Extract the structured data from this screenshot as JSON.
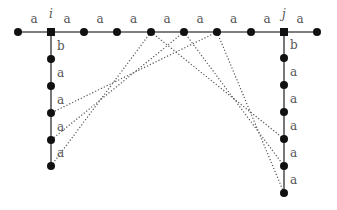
{
  "colors": {
    "edge": "#555555",
    "node": "#111111",
    "dotted": "#555555",
    "label": "#555555"
  },
  "top_row": {
    "y": 32,
    "nodes": [
      {
        "x": 18,
        "shape": "circle"
      },
      {
        "x": 51,
        "shape": "square",
        "name": "i"
      },
      {
        "x": 84,
        "shape": "circle"
      },
      {
        "x": 117,
        "shape": "circle"
      },
      {
        "x": 151,
        "shape": "circle"
      },
      {
        "x": 184,
        "shape": "circle"
      },
      {
        "x": 217,
        "shape": "circle"
      },
      {
        "x": 251,
        "shape": "circle"
      },
      {
        "x": 284,
        "shape": "square",
        "name": "j"
      },
      {
        "x": 317,
        "shape": "circle"
      }
    ],
    "edge_labels": [
      "a",
      "a",
      "a",
      "a",
      "a",
      "a",
      "a",
      "a",
      "a"
    ]
  },
  "left_column": {
    "x": 51,
    "nodes_y": [
      59,
      86,
      113,
      140,
      166
    ],
    "edge_labels": [
      "b",
      "a",
      "a",
      "a",
      "a"
    ]
  },
  "right_column": {
    "x": 284,
    "nodes_y": [
      58,
      85,
      112,
      139,
      166,
      193
    ],
    "edge_labels": [
      "b",
      "a",
      "a",
      "a",
      "a",
      "a"
    ]
  },
  "vertex_labels": {
    "i": "i",
    "j": "j"
  },
  "dotted_edges": [
    {
      "from": [
        151,
        32
      ],
      "to": [
        51,
        166
      ]
    },
    {
      "from": [
        184,
        32
      ],
      "to": [
        51,
        140
      ]
    },
    {
      "from": [
        217,
        32
      ],
      "to": [
        51,
        113
      ]
    },
    {
      "from": [
        151,
        32
      ],
      "to": [
        284,
        139
      ]
    },
    {
      "from": [
        184,
        32
      ],
      "to": [
        284,
        166
      ]
    },
    {
      "from": [
        217,
        32
      ],
      "to": [
        284,
        193
      ]
    }
  ]
}
